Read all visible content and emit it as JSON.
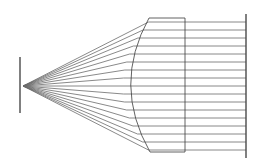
{
  "figure": {
    "type": "optical-ray-diagram",
    "width": 266,
    "height": 168,
    "background_color": "#ffffff",
    "stroke_color": "#585858",
    "ray_stroke_color": "#6b6b6b",
    "outline_stroke_color": "#3a3a3a",
    "axis_stroke_color": "#4a4a4a",
    "stroke_width": 0.8,
    "axis_stroke_width": 1.4
  },
  "source_axis": {
    "label": "source-plane",
    "x": 20,
    "y_top": 57,
    "y_bottom": 113
  },
  "focal_point": {
    "label": "focal-point",
    "x": 23,
    "y": 86
  },
  "lens": {
    "label": "plano-convex-lens",
    "flat_face_x": 185,
    "top_y": 18,
    "bottom_y": 152,
    "curved_vertex_x": 123,
    "curved_edge_top_x": 149,
    "curved_edge_bottom_x": 150,
    "curve_control_x": 112,
    "top_edge": {
      "x1": 149,
      "y1": 18,
      "x2": 185,
      "y2": 18
    },
    "bottom_edge": {
      "x1": 150,
      "y1": 152,
      "x2": 185,
      "y2": 152
    },
    "flat_edge": {
      "x1": 185,
      "y1": 18,
      "x2": 185,
      "y2": 152
    }
  },
  "screen_axis": {
    "label": "image-screen",
    "x": 246,
    "y_top": 14,
    "y_bottom": 158
  },
  "chart_data": {
    "type": "line",
    "xlabel": "",
    "ylabel": "",
    "xlim": [
      0,
      266
    ],
    "ylim": [
      0,
      168
    ],
    "grid": false,
    "legend": "none",
    "annotations": [
      "Rays converge to a point focus at the left source plane",
      "Rays refract at the curved surface and exit parallel",
      "Parallel rays travel to the vertical screen at right"
    ],
    "ray_count": 17,
    "rays": [
      {
        "id": 1,
        "y_exit": 22,
        "x_lens": 148.6
      },
      {
        "id": 2,
        "y_exit": 30,
        "x_lens": 143.0
      },
      {
        "id": 3,
        "y_exit": 38,
        "x_lens": 137.9
      },
      {
        "id": 4,
        "y_exit": 46,
        "x_lens": 133.4
      },
      {
        "id": 5,
        "y_exit": 54,
        "x_lens": 129.7
      },
      {
        "id": 6,
        "y_exit": 62,
        "x_lens": 126.8
      },
      {
        "id": 7,
        "y_exit": 70,
        "x_lens": 124.8
      },
      {
        "id": 8,
        "y_exit": 78,
        "x_lens": 123.5
      },
      {
        "id": 9,
        "y_exit": 86,
        "x_lens": 123.0
      },
      {
        "id": 10,
        "y_exit": 94,
        "x_lens": 123.4
      },
      {
        "id": 11,
        "y_exit": 102,
        "x_lens": 124.6
      },
      {
        "id": 12,
        "y_exit": 110,
        "x_lens": 126.6
      },
      {
        "id": 13,
        "y_exit": 118,
        "x_lens": 129.4
      },
      {
        "id": 14,
        "y_exit": 126,
        "x_lens": 133.0
      },
      {
        "id": 15,
        "y_exit": 134,
        "x_lens": 137.5
      },
      {
        "id": 16,
        "y_exit": 142,
        "x_lens": 142.7
      },
      {
        "id": 17,
        "y_exit": 150,
        "x_lens": 148.5
      }
    ]
  }
}
